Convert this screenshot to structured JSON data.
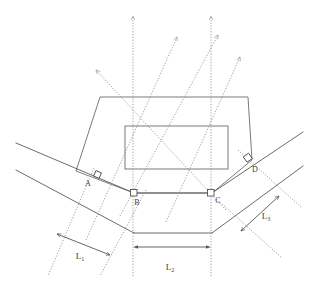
{
  "diagram": {
    "background_color": "#ffffff",
    "line_color": "#5a5a5a",
    "dotted_color": "#8e8e8e",
    "text_color": "#3a3a3a",
    "width": 318,
    "height": 281,
    "point_labels": [
      {
        "id": "A",
        "text": "A",
        "x": 88,
        "y": 186
      },
      {
        "id": "B",
        "text": "B",
        "x": 137,
        "y": 205
      },
      {
        "id": "C",
        "text": "C",
        "x": 215,
        "y": 203
      },
      {
        "id": "D",
        "text": "D",
        "x": 253,
        "y": 171
      }
    ],
    "dimension_labels": [
      {
        "id": "L1",
        "base": "L",
        "sub": "1",
        "x": 80,
        "y": 257
      },
      {
        "id": "L2",
        "base": "L",
        "sub": "2",
        "x": 168,
        "y": 268
      },
      {
        "id": "L3",
        "base": "L",
        "sub": "3",
        "x": 263,
        "y": 215
      }
    ],
    "features": {
      "outer_polygon": "hexagonal island outline",
      "inner_rectangle": "central rectangular island",
      "left_roadway": "two parallel solid lines descending to the right",
      "right_roadway": "two parallel solid lines ascending to the right",
      "sight_lines": "dotted lines with arrowheads",
      "right_angle_marks": 4
    }
  }
}
